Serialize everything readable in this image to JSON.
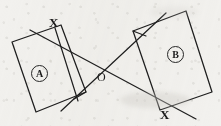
{
  "figure": {
    "kind": "geometry-diagram",
    "background_color": "#f2f1ee",
    "ink_color": "#1b1b1b",
    "width": 221,
    "height": 126,
    "labels": {
      "x_top_left": "X",
      "x_bottom_right": "X",
      "intersection": "O",
      "rect_a": "A",
      "rect_b": "B"
    },
    "shapes": {
      "rect_a": {
        "name": "rectangle-a",
        "label": "A",
        "points": "12,42 61,25 86,92 36,112"
      },
      "rect_b": {
        "name": "rectangle-b",
        "label": "B",
        "points": "133,31 186,11 212,92 160,110"
      }
    },
    "lines": {
      "line_one": {
        "name": "transversal-line-one",
        "from": "30,30",
        "to": "196,119",
        "description": "descends from upper-left X through O to lower-right X"
      },
      "line_two": {
        "name": "transversal-line-two",
        "from": "61,111",
        "to": "166,13",
        "description": "rises from lower-left corner of A through O to upper-left corner of B"
      },
      "chord_a": {
        "name": "chord-rect-a",
        "from": "55,28",
        "to": "78,101",
        "description": "short stroke inside rectangle A from top X corner to lower edge"
      }
    },
    "points": {
      "o": {
        "name": "point-o",
        "x": 113,
        "y": 70
      },
      "x_left": {
        "name": "point-x-left",
        "x": 55,
        "y": 28
      },
      "x_right": {
        "name": "point-x-right",
        "x": 162,
        "y": 106
      }
    }
  }
}
